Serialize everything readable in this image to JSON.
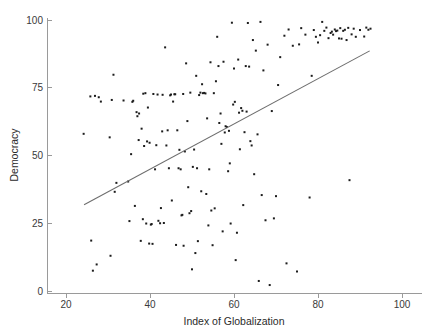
{
  "chart_data": {
    "type": "scatter",
    "title": "",
    "xlabel": "Index of Globalization",
    "ylabel": "Democracy",
    "xlim": [
      14,
      104
    ],
    "ylim": [
      -2,
      102
    ],
    "xticks": [
      20,
      40,
      60,
      80,
      100
    ],
    "xticklabels": [
      "20",
      "40",
      "60",
      "80",
      "100"
    ],
    "yticks": [
      0,
      25,
      50,
      75,
      100
    ],
    "yticklabels": [
      "0",
      "25",
      "50",
      "75",
      "100"
    ],
    "grid": false,
    "legend": null,
    "marker": "square-dot",
    "marker_color": "#1c1c1c",
    "marker_size": 2.0,
    "fit_line": {
      "type": "linear-regression",
      "color": "#6d6d6d",
      "x_start": 24.3,
      "y_start": 31.8,
      "x_end": 92.3,
      "y_end": 88.6
    },
    "points": [
      [
        24.2,
        58.0
      ],
      [
        25.8,
        71.8
      ],
      [
        26.0,
        18.6
      ],
      [
        26.4,
        7.5
      ],
      [
        26.9,
        72.0
      ],
      [
        27.3,
        9.8
      ],
      [
        27.8,
        71.5
      ],
      [
        28.3,
        69.9
      ],
      [
        30.4,
        56.7
      ],
      [
        30.6,
        13.0
      ],
      [
        30.9,
        70.5
      ],
      [
        31.3,
        79.8
      ],
      [
        31.6,
        36.6
      ],
      [
        32.0,
        39.9
      ],
      [
        33.7,
        70.3
      ],
      [
        34.8,
        40.4
      ],
      [
        35.1,
        25.8
      ],
      [
        35.5,
        50.5
      ],
      [
        35.8,
        69.8
      ],
      [
        36.0,
        70.2
      ],
      [
        36.4,
        31.4
      ],
      [
        36.8,
        66.0
      ],
      [
        37.0,
        64.5
      ],
      [
        37.3,
        55.7
      ],
      [
        37.4,
        65.5
      ],
      [
        37.8,
        18.5
      ],
      [
        38.0,
        59.9
      ],
      [
        38.3,
        26.5
      ],
      [
        38.4,
        72.8
      ],
      [
        38.6,
        53.5
      ],
      [
        38.9,
        73.0
      ],
      [
        39.1,
        24.9
      ],
      [
        39.3,
        55.2
      ],
      [
        39.5,
        67.7
      ],
      [
        39.8,
        17.5
      ],
      [
        39.9,
        54.7
      ],
      [
        40.2,
        24.5
      ],
      [
        40.4,
        24.7
      ],
      [
        40.6,
        17.4
      ],
      [
        40.8,
        72.7
      ],
      [
        41.2,
        44.9
      ],
      [
        41.5,
        53.8
      ],
      [
        41.8,
        72.5
      ],
      [
        42.0,
        25.9
      ],
      [
        42.4,
        25.0
      ],
      [
        42.6,
        30.6
      ],
      [
        42.9,
        58.9
      ],
      [
        43.0,
        72.4
      ],
      [
        43.3,
        25.1
      ],
      [
        43.6,
        89.9
      ],
      [
        43.9,
        53.7
      ],
      [
        44.2,
        59.3
      ],
      [
        44.5,
        45.3
      ],
      [
        44.8,
        72.2
      ],
      [
        45.0,
        72.5
      ],
      [
        45.2,
        33.4
      ],
      [
        45.5,
        69.9
      ],
      [
        45.8,
        72.6
      ],
      [
        46.0,
        72.6
      ],
      [
        46.2,
        17.0
      ],
      [
        46.5,
        59.3
      ],
      [
        46.8,
        45.3
      ],
      [
        47.0,
        52.1
      ],
      [
        47.3,
        44.9
      ],
      [
        47.5,
        27.9
      ],
      [
        47.7,
        28.1
      ],
      [
        47.9,
        72.7
      ],
      [
        48.0,
        16.7
      ],
      [
        48.3,
        51.5
      ],
      [
        48.6,
        84.0
      ],
      [
        48.9,
        62.7
      ],
      [
        49.1,
        38.3
      ],
      [
        49.4,
        28.7
      ],
      [
        49.6,
        73.2
      ],
      [
        49.8,
        29.5
      ],
      [
        50.0,
        8.0
      ],
      [
        50.2,
        45.8
      ],
      [
        50.5,
        52.2
      ],
      [
        50.8,
        14.0
      ],
      [
        51.0,
        79.4
      ],
      [
        51.2,
        45.3
      ],
      [
        51.4,
        18.4
      ],
      [
        51.7,
        72.3
      ],
      [
        52.0,
        73.2
      ],
      [
        52.2,
        36.8
      ],
      [
        52.4,
        76.3
      ],
      [
        52.6,
        73.0
      ],
      [
        52.9,
        73.1
      ],
      [
        53.2,
        72.9
      ],
      [
        53.4,
        35.8
      ],
      [
        53.6,
        63.7
      ],
      [
        53.9,
        24.2
      ],
      [
        54.1,
        44.9
      ],
      [
        54.4,
        84.4
      ],
      [
        54.6,
        29.7
      ],
      [
        54.9,
        16.9
      ],
      [
        55.2,
        73.0
      ],
      [
        55.4,
        30.5
      ],
      [
        55.7,
        77.4
      ],
      [
        56.0,
        93.8
      ],
      [
        56.3,
        83.0
      ],
      [
        56.5,
        62.0
      ],
      [
        56.8,
        65.5
      ],
      [
        57.0,
        54.3
      ],
      [
        57.3,
        22.0
      ],
      [
        57.5,
        84.6
      ],
      [
        57.8,
        58.5
      ],
      [
        58.0,
        60.8
      ],
      [
        58.3,
        60.5
      ],
      [
        58.6,
        44.2
      ],
      [
        58.8,
        59.1
      ],
      [
        59.0,
        47.1
      ],
      [
        59.2,
        24.9
      ],
      [
        59.5,
        99.0
      ],
      [
        59.8,
        68.8
      ],
      [
        60.0,
        82.1
      ],
      [
        60.2,
        69.8
      ],
      [
        60.4,
        11.4
      ],
      [
        60.7,
        21.5
      ],
      [
        61.0,
        85.4
      ],
      [
        61.2,
        65.8
      ],
      [
        61.4,
        52.3
      ],
      [
        61.7,
        67.5
      ],
      [
        62.0,
        66.5
      ],
      [
        62.2,
        31.7
      ],
      [
        62.5,
        58.6
      ],
      [
        62.8,
        83.0
      ],
      [
        63.0,
        66.2
      ],
      [
        63.3,
        98.9
      ],
      [
        63.6,
        82.8
      ],
      [
        63.9,
        55.3
      ],
      [
        64.2,
        53.7
      ],
      [
        64.5,
        92.6
      ],
      [
        64.8,
        43.1
      ],
      [
        65.2,
        88.7
      ],
      [
        65.6,
        57.8
      ],
      [
        65.9,
        3.7
      ],
      [
        66.3,
        99.3
      ],
      [
        66.6,
        35.4
      ],
      [
        67.0,
        81.4
      ],
      [
        67.5,
        26.1
      ],
      [
        68.0,
        90.9
      ],
      [
        68.5,
        2.2
      ],
      [
        69.0,
        66.4
      ],
      [
        69.5,
        26.8
      ],
      [
        70.0,
        35.0
      ],
      [
        70.5,
        76.0
      ],
      [
        71.0,
        86.3
      ],
      [
        72.0,
        94.2
      ],
      [
        72.5,
        10.2
      ],
      [
        73.0,
        96.5
      ],
      [
        74.0,
        90.5
      ],
      [
        75.0,
        7.2
      ],
      [
        75.5,
        91.0
      ],
      [
        76.0,
        97.0
      ],
      [
        77.0,
        94.6
      ],
      [
        78.0,
        34.5
      ],
      [
        78.5,
        79.4
      ],
      [
        79.0,
        96.3
      ],
      [
        79.5,
        93.8
      ],
      [
        80.0,
        91.7
      ],
      [
        80.5,
        94.4
      ],
      [
        81.0,
        99.3
      ],
      [
        81.5,
        96.0
      ],
      [
        82.0,
        97.2
      ],
      [
        82.5,
        93.3
      ],
      [
        83.0,
        95.2
      ],
      [
        83.3,
        95.7
      ],
      [
        83.6,
        94.6
      ],
      [
        84.0,
        96.5
      ],
      [
        84.3,
        95.9
      ],
      [
        84.6,
        96.1
      ],
      [
        85.0,
        93.2
      ],
      [
        85.3,
        97.0
      ],
      [
        85.6,
        93.1
      ],
      [
        86.0,
        96.0
      ],
      [
        86.4,
        96.4
      ],
      [
        86.8,
        92.6
      ],
      [
        87.2,
        97.1
      ],
      [
        87.5,
        40.9
      ],
      [
        88.0,
        94.7
      ],
      [
        88.5,
        96.8
      ],
      [
        89.0,
        93.8
      ],
      [
        90.0,
        96.3
      ],
      [
        91.0,
        93.9
      ],
      [
        91.5,
        97.2
      ],
      [
        92.0,
        96.4
      ],
      [
        92.5,
        96.8
      ]
    ]
  }
}
